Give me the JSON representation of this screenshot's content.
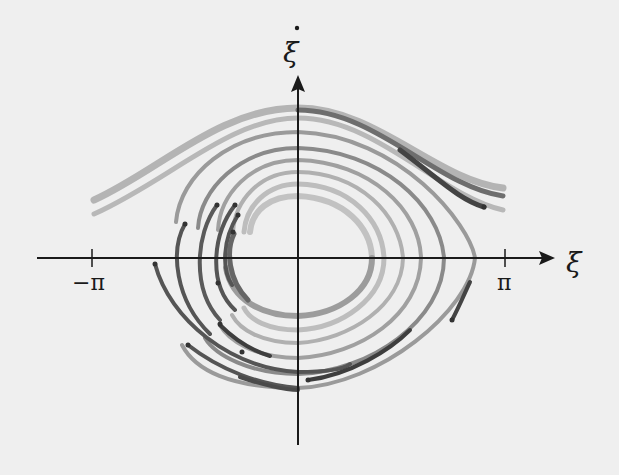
{
  "diagram": {
    "type": "phase-portrait",
    "x_axis": {
      "label": "ξ",
      "ticks": [
        {
          "label": "−π",
          "value": -3.14159
        },
        {
          "label": "π",
          "value": 3.14159
        }
      ]
    },
    "y_axis": {
      "label": "ξ",
      "label_dot": "˙"
    },
    "colors": {
      "background": "#efefef",
      "axis": "#1a1a1a",
      "curve_dark": "#4a4a4a",
      "curve_mid": "#7a7a7a",
      "curve_light": "#a8a8a8",
      "curve_lightest": "#c4c4c4"
    },
    "rotating_orbits": 2,
    "librating_orbits": 6,
    "partial_arcs": 6
  }
}
